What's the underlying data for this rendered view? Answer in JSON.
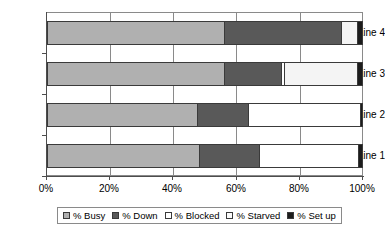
{
  "chart_data": {
    "type": "bar",
    "orientation": "horizontal",
    "stacked": true,
    "title": "",
    "xlabel": "",
    "ylabel": "",
    "xlim": [
      0,
      100
    ],
    "grid": true,
    "legend_position": "bottom",
    "categories": [
      "Line 1",
      "Line 2",
      "Line 3",
      "Line 4"
    ],
    "x_tick_labels": [
      "0%",
      "20%",
      "40%",
      "60%",
      "80%",
      "100%"
    ],
    "x_tick_values": [
      0,
      20,
      40,
      60,
      80,
      100
    ],
    "series": [
      {
        "name": "% Busy",
        "color": "#b0b0b0",
        "values": [
          48,
          47.5,
          56,
          56
        ]
      },
      {
        "name": "% Down",
        "color": "#595959",
        "values": [
          19,
          16,
          18,
          37
        ]
      },
      {
        "name": "% Blocked",
        "color": "#ffffff",
        "values": [
          31.5,
          35.5,
          1,
          0
        ]
      },
      {
        "name": "% Starved",
        "color": "#f4f4f4",
        "values": [
          0,
          0,
          23,
          5
        ]
      },
      {
        "name": "% Set up",
        "color": "#1c1c1c",
        "values": [
          1.5,
          1,
          2,
          2
        ]
      }
    ]
  },
  "legend": {
    "items": [
      {
        "label": "% Busy",
        "swatch": "#b0b0b0"
      },
      {
        "label": "% Down",
        "swatch": "#595959"
      },
      {
        "label": "% Blocked",
        "swatch": "#ffffff"
      },
      {
        "label": "% Starved",
        "swatch": "#fbfbfb"
      },
      {
        "label": "% Set up",
        "swatch": "#1c1c1c"
      }
    ]
  },
  "axes": {
    "y_labels": [
      "Line 4",
      "Line 3",
      "Line 2",
      "Line 1"
    ],
    "x_labels": [
      "0%",
      "20%",
      "40%",
      "60%",
      "80%",
      "100%"
    ]
  }
}
